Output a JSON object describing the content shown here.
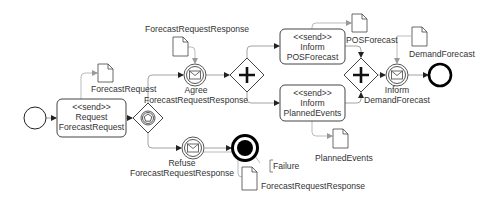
{
  "diagram": {
    "type": "BPMN process",
    "events": {
      "start": {
        "label": ""
      },
      "agree": {
        "line1": "Agree",
        "line2": "ForecastRequestResponse"
      },
      "refuse": {
        "line1": "Refuse",
        "line2": "ForecastRequestResponse"
      },
      "inform_demand": {
        "line1": "Inform",
        "line2": "DemandForecast"
      },
      "end": {
        "label": ""
      },
      "failure_end": {
        "label": "Failure"
      }
    },
    "tasks": {
      "request": {
        "stereotype": "<<send>>",
        "line1": "Request",
        "line2": "ForecastRequest"
      },
      "inform_pos": {
        "stereotype": "<<send>>",
        "line1": "Inform",
        "line2": "POSForecast"
      },
      "inform_planned": {
        "stereotype": "<<send>>",
        "line1": "Inform",
        "line2": "PlannedEvents"
      }
    },
    "data_objects": {
      "forecast_request": {
        "label": "ForecastRequest"
      },
      "forecast_request_response_top": {
        "label": "ForecastRequestResponse"
      },
      "forecast_request_response_bottom": {
        "label": "ForecastRequestResponse"
      },
      "pos_forecast": {
        "label": "POSForecast"
      },
      "planned_events": {
        "label": "PlannedEvents"
      },
      "demand_forecast": {
        "label": "DemandForecast"
      }
    },
    "gateways": {
      "event_based": {
        "kind": "event-based"
      },
      "parallel_split": {
        "kind": "parallel"
      },
      "parallel_join": {
        "kind": "parallel"
      }
    }
  }
}
